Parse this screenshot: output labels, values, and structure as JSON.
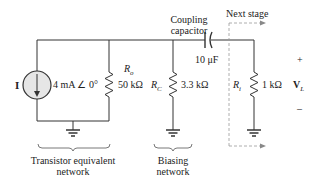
{
  "labels": {
    "source_symbol": "I",
    "source_value": "4 mA ∠ 0°",
    "ro_name": "R",
    "ro_sub": "o",
    "ro_value": "50 kΩ",
    "rc_name": "R",
    "rc_sub": "C",
    "rc_value": "3.3 kΩ",
    "coupling_line1": "Coupling",
    "coupling_line2": "capacitor",
    "cap_value": "10 μF",
    "next_stage": "Next stage",
    "ri_name": "R",
    "ri_sub": "i",
    "ri_value": "1 kΩ",
    "vl_name": "V",
    "vl_sub": "L",
    "plus": "+",
    "minus": "–",
    "transistor_line1": "Transistor equivalent",
    "transistor_line2": "network",
    "biasing_line1": "Biasing",
    "biasing_line2": "network"
  },
  "colors": {
    "wire": "#333333",
    "source_fill": "#e6e6e6",
    "dashed": "#999999"
  }
}
